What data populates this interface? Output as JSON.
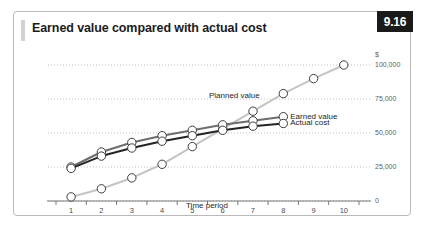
{
  "figure": {
    "number": "9.16",
    "title": "Earned value compared with actual cost"
  },
  "chart_data": {
    "type": "line",
    "title": "Earned value compared with actual cost",
    "xlabel": "Time period",
    "ylabel": "$",
    "x": [
      1,
      2,
      3,
      4,
      5,
      6,
      7,
      8,
      9,
      10
    ],
    "xlim": [
      0.5,
      10.5
    ],
    "ylim": [
      0,
      100000
    ],
    "yticks": [
      0,
      25000,
      50000,
      75000,
      100000
    ],
    "ytick_labels": [
      "0",
      "25,000",
      "50,000",
      "75,000",
      "100,000"
    ],
    "xtick_labels": [
      "1",
      "2",
      "3",
      "4",
      "5",
      "6",
      "7",
      "8",
      "9",
      "10"
    ],
    "grid": true,
    "grid_style": "dotted",
    "legend_position": "inline-right",
    "series": [
      {
        "name": "Planned value",
        "color": "#c4c4c4",
        "x": [
          1,
          2,
          3,
          4,
          5,
          6,
          7,
          8,
          9,
          10
        ],
        "values": [
          3000,
          9000,
          17000,
          27000,
          40000,
          53000,
          66000,
          79000,
          90000,
          100000
        ],
        "label_x": 7,
        "marker": "open-circle"
      },
      {
        "name": "Earned value",
        "color": "#6e6e6e",
        "x": [
          1,
          2,
          3,
          4,
          5,
          6,
          7,
          8
        ],
        "values": [
          25000,
          36000,
          43000,
          48000,
          52000,
          56000,
          59000,
          62000
        ],
        "label_x": 8,
        "marker": "open-circle"
      },
      {
        "name": "Actual cost",
        "color": "#242424",
        "x": [
          1,
          2,
          3,
          4,
          5,
          6,
          7,
          8
        ],
        "values": [
          24000,
          33000,
          39000,
          44000,
          48000,
          52000,
          55000,
          57000
        ],
        "label_x": 8,
        "marker": "open-circle"
      }
    ]
  }
}
